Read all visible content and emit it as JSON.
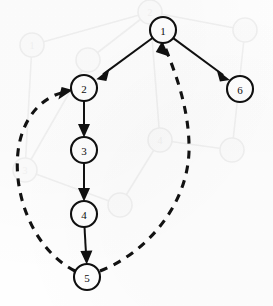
{
  "diagram": {
    "canvas": {
      "width": 273,
      "height": 306,
      "background": "#fefefe"
    },
    "node_style": {
      "radius": 13,
      "fill": "#ffffff",
      "stroke": "#101010",
      "stroke_width": 2.1
    },
    "edge_style": {
      "solid_color": "#101010",
      "solid_width": 2.0,
      "dashed_color": "#121212",
      "dashed_width": 3.1,
      "dash_pattern": "8 7"
    },
    "nodes": [
      {
        "id": "1",
        "label": "1",
        "x": 163,
        "y": 30
      },
      {
        "id": "2",
        "label": "2",
        "x": 84,
        "y": 88
      },
      {
        "id": "3",
        "label": "3",
        "x": 84,
        "y": 150
      },
      {
        "id": "4",
        "label": "4",
        "x": 84,
        "y": 214
      },
      {
        "id": "5",
        "label": "5",
        "x": 87,
        "y": 277
      },
      {
        "id": "6",
        "label": "6",
        "x": 240,
        "y": 89
      }
    ],
    "edges": [
      {
        "id": "e-1-2",
        "from": "1",
        "to": "2",
        "style": "solid",
        "shape": "straight"
      },
      {
        "id": "e-1-6",
        "from": "1",
        "to": "6",
        "style": "solid",
        "shape": "straight"
      },
      {
        "id": "e-2-3",
        "from": "2",
        "to": "3",
        "style": "solid",
        "shape": "straight"
      },
      {
        "id": "e-3-4",
        "from": "3",
        "to": "4",
        "style": "solid",
        "shape": "straight"
      },
      {
        "id": "e-4-5",
        "from": "4",
        "to": "5",
        "style": "solid",
        "shape": "straight"
      },
      {
        "id": "e-5-2",
        "from": "5",
        "to": "2",
        "style": "dashed",
        "shape": "curve-left"
      },
      {
        "id": "e-5-1",
        "from": "5",
        "to": "1",
        "style": "dashed",
        "shape": "curve-right"
      }
    ],
    "watermark": {
      "visible": true,
      "color": "#f1f1f1",
      "description": "faint ghost copy of a similar node-link graph behind the main drawing"
    }
  }
}
